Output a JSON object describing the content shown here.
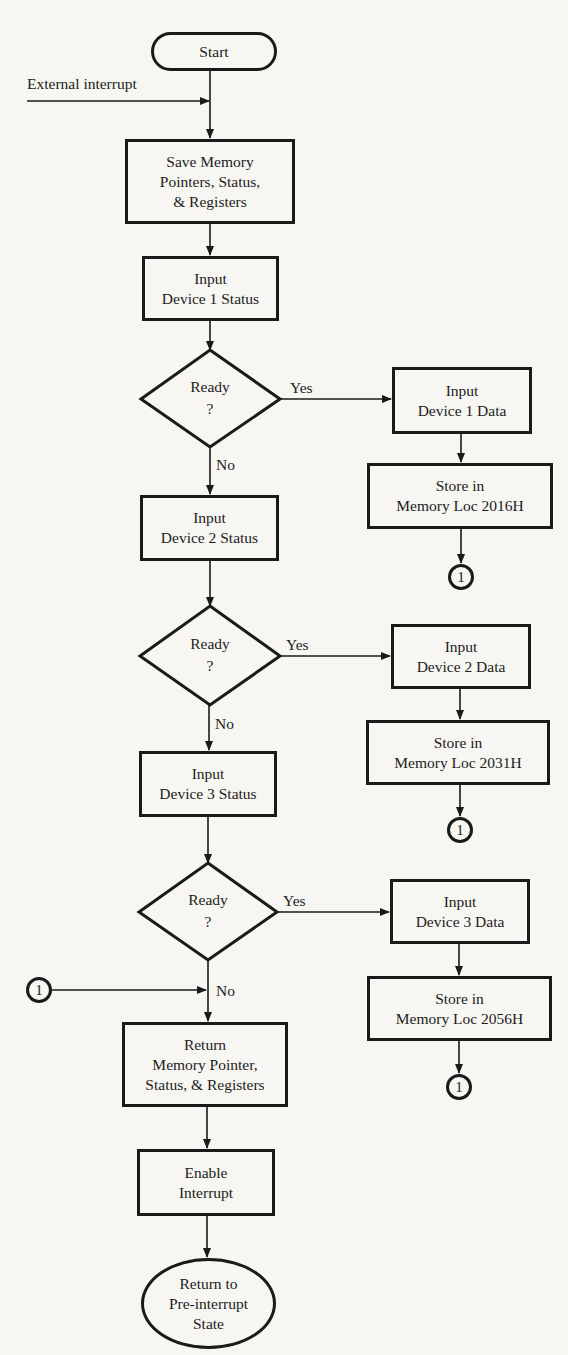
{
  "diagram": {
    "type": "flowchart",
    "colors": {
      "background": "#f7f6f2",
      "ink": "#1a1a1a"
    },
    "start": {
      "label": "Start"
    },
    "external_interrupt": {
      "label": "External interrupt"
    },
    "save": {
      "label": "Save Memory\nPointers, Status,\n& Registers"
    },
    "devices": [
      {
        "status": {
          "label": "Input\nDevice 1 Status"
        },
        "decision": {
          "label": "Ready\n?",
          "yes": "Yes",
          "no": "No"
        },
        "data": {
          "label": "Input\nDevice 1 Data"
        },
        "store": {
          "label": "Store  in\nMemory   Loc 2016H"
        },
        "connector": {
          "label": "1"
        }
      },
      {
        "status": {
          "label": "Input\nDevice 2 Status"
        },
        "decision": {
          "label": "Ready\n?",
          "yes": "Yes",
          "no": "No"
        },
        "data": {
          "label": "Input\nDevice 2 Data"
        },
        "store": {
          "label": "Store in\nMemory Loc 2031H"
        },
        "connector": {
          "label": "1"
        }
      },
      {
        "status": {
          "label": "Input\nDevice 3 Status"
        },
        "decision": {
          "label": "Ready\n?",
          "yes": "Yes",
          "no": "No"
        },
        "data": {
          "label": "Input\nDevice 3 Data"
        },
        "store": {
          "label": "Store  in\nMemory  Loc 2056H"
        },
        "connector": {
          "label": "1"
        }
      }
    ],
    "merge_connector": {
      "label": "1"
    },
    "restore": {
      "label": "Return\nMemory Pointer,\nStatus, & Registers"
    },
    "enable": {
      "label": "Enable\nInterrupt"
    },
    "end": {
      "label": "Return to\nPre-interrupt\nState"
    }
  }
}
